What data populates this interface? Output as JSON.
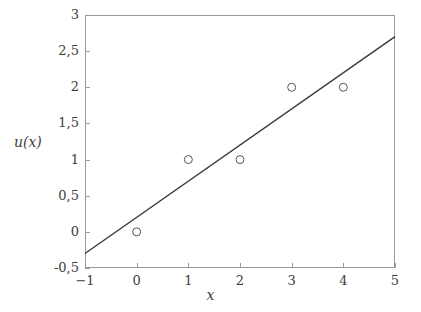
{
  "chart_data": {
    "type": "scatter",
    "title": "",
    "subtitle": "",
    "xlabel": "x",
    "ylabel": "u(x)",
    "xlim": [
      -1,
      5
    ],
    "ylim": [
      -0.5,
      3
    ],
    "grid": false,
    "legend": false,
    "legend_position": "none",
    "decimal_separator": ",",
    "xticks": [
      -1,
      0,
      1,
      2,
      3,
      4,
      5
    ],
    "xtick_labels": [
      "−1",
      "0",
      "1",
      "2",
      "3",
      "4",
      "5"
    ],
    "yticks": [
      -0.5,
      0,
      0.5,
      1,
      1.5,
      2,
      2.5,
      3
    ],
    "ytick_labels": [
      "-0,5",
      "0",
      "0,5",
      "1",
      "1,5",
      "2",
      "2,5",
      "3"
    ],
    "series": [
      {
        "name": "data-points",
        "type": "scatter",
        "marker": "open-circle",
        "marker_size": 4,
        "color": "#555555",
        "points": [
          {
            "x": 0,
            "y": 0
          },
          {
            "x": 1,
            "y": 1
          },
          {
            "x": 2,
            "y": 1
          },
          {
            "x": 3,
            "y": 2
          },
          {
            "x": 4,
            "y": 2
          }
        ]
      },
      {
        "name": "linear-fit-line",
        "type": "line",
        "color": "#3a3a3a",
        "line_width": 1.4,
        "slope": 0.5,
        "intercept": 0.2,
        "points": [
          {
            "x": -1,
            "y": -0.3
          },
          {
            "x": 5,
            "y": 2.7
          }
        ]
      }
    ]
  },
  "axes": {
    "frame_color": "#9a9a9a",
    "background": "#ffffff",
    "tick_direction": "in"
  }
}
